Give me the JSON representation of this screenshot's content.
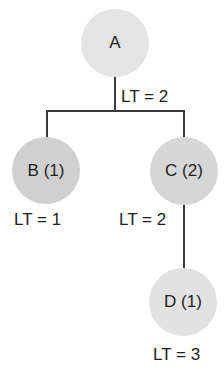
{
  "diagram": {
    "type": "tree",
    "nodes": [
      {
        "id": "A",
        "label": "A",
        "lt_label": "LT = 2",
        "fill": "#e4e4e4"
      },
      {
        "id": "B",
        "label": "B (1)",
        "lt_label": "LT = 1",
        "fill": "#d0d0d0"
      },
      {
        "id": "C",
        "label": "C (2)",
        "lt_label": "LT = 2",
        "fill": "#d6d6d6"
      },
      {
        "id": "D",
        "label": "D (1)",
        "lt_label": "LT = 3",
        "fill": "#e2e2e2"
      }
    ],
    "edges": [
      {
        "from": "A",
        "to": "B"
      },
      {
        "from": "A",
        "to": "C"
      },
      {
        "from": "C",
        "to": "D"
      }
    ],
    "line_color": "#3a3a3a"
  }
}
